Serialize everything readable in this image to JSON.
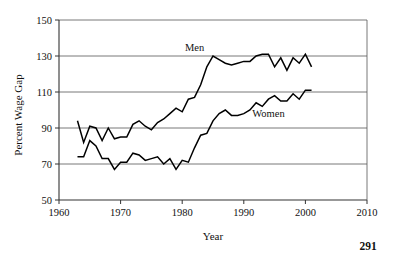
{
  "page": {
    "number": "291"
  },
  "chart_data": {
    "type": "line",
    "title": "",
    "xlabel": "Year",
    "ylabel": "Percent Wage Gap",
    "xlim": [
      1960,
      2010
    ],
    "ylim": [
      50,
      150
    ],
    "xticks": [
      1960,
      1970,
      1980,
      1990,
      2000,
      2010
    ],
    "xtick_labels": [
      "1960",
      "1970",
      "1980",
      "1990",
      "2000",
      "2010"
    ],
    "yticks": [
      50,
      70,
      90,
      110,
      130,
      150
    ],
    "ytick_labels": [
      "50",
      "70",
      "90",
      "110",
      "130",
      "150"
    ],
    "grid": "horizontal",
    "legend": "inline-annotations",
    "annotations": [
      {
        "text": "Men",
        "x": 1982,
        "y": 133
      },
      {
        "text": "Women",
        "x": 1994,
        "y": 96
      }
    ],
    "series": [
      {
        "name": "Men",
        "x": [
          1963,
          1964,
          1965,
          1966,
          1967,
          1968,
          1969,
          1970,
          1971,
          1972,
          1973,
          1974,
          1975,
          1976,
          1977,
          1978,
          1979,
          1980,
          1981,
          1982,
          1983,
          1984,
          1985,
          1986,
          1987,
          1988,
          1989,
          1990,
          1991,
          1992,
          1993,
          1994,
          1995,
          1996,
          1997,
          1998,
          1999,
          2000,
          2001
        ],
        "values": [
          94,
          82,
          91,
          90,
          83,
          90,
          84,
          85,
          85,
          92,
          94,
          91,
          89,
          93,
          95,
          98,
          101,
          99,
          106,
          107,
          114,
          124,
          130,
          128,
          126,
          125,
          126,
          127,
          127,
          130,
          131,
          131,
          124,
          129,
          122,
          129,
          126,
          131,
          124
        ]
      },
      {
        "name": "Women",
        "x": [
          1963,
          1964,
          1965,
          1966,
          1967,
          1968,
          1969,
          1970,
          1971,
          1972,
          1973,
          1974,
          1975,
          1976,
          1977,
          1978,
          1979,
          1980,
          1981,
          1982,
          1983,
          1984,
          1985,
          1986,
          1987,
          1988,
          1989,
          1990,
          1991,
          1992,
          1993,
          1994,
          1995,
          1996,
          1997,
          1998,
          1999,
          2000,
          2001
        ],
        "values": [
          74,
          74,
          83,
          80,
          73,
          73,
          67,
          71,
          71,
          76,
          75,
          72,
          73,
          74,
          70,
          73,
          67,
          72,
          71,
          79,
          86,
          87,
          94,
          98,
          100,
          97,
          97,
          98,
          100,
          104,
          102,
          106,
          108,
          105,
          105,
          109,
          106,
          111,
          111
        ]
      }
    ]
  }
}
